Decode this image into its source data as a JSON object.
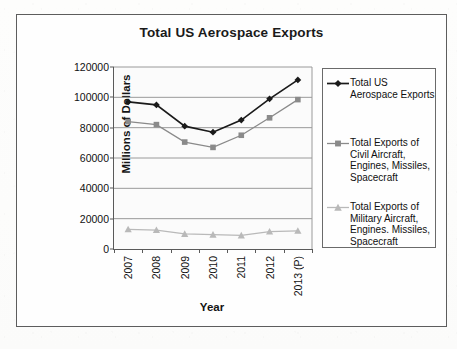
{
  "chart_data": {
    "type": "line",
    "title": "Total US Aerospace Exports",
    "xlabel": "Year",
    "ylabel": "Millions of Dollars",
    "categories": [
      "2007",
      "2008",
      "2009",
      "2010",
      "2011",
      "2012",
      "2013 (P)"
    ],
    "ylim": [
      0,
      120000
    ],
    "yticks": [
      0,
      20000,
      40000,
      60000,
      80000,
      100000,
      120000
    ],
    "ytick_labels": [
      "0",
      "20000",
      "40000",
      "60000",
      "80000",
      "100000",
      "120000"
    ],
    "grid": true,
    "legend_position": "right",
    "series": [
      {
        "name": "Total US Aerospace Exports",
        "marker": "diamond",
        "color": "#1a1a1a",
        "values": [
          97000,
          95000,
          81000,
          77000,
          85000,
          99000,
          111500
        ]
      },
      {
        "name": "Total Exports of Civil Aircraft, Engines, Missiles, Spacecraft",
        "marker": "square",
        "color": "#8a8a8a",
        "values": [
          84000,
          82000,
          70500,
          67000,
          75000,
          86500,
          98500
        ]
      },
      {
        "name": "Total Exports of Military Aircraft, Engines. Missiles, Spacecraft",
        "marker": "triangle",
        "color": "#b9b9b9",
        "values": [
          13000,
          12500,
          10000,
          9500,
          9000,
          11500,
          12000
        ]
      }
    ]
  },
  "legend": {
    "entries": [
      {
        "label": "Total US Aerospace Exports"
      },
      {
        "label": "Total Exports of Civil Aircraft, Engines, Missiles, Spacecraft"
      },
      {
        "label": "Total Exports of Military Aircraft, Engines. Missiles, Spacecraft"
      }
    ]
  },
  "colors": {
    "series_total": "#1a1a1a",
    "series_civil": "#8a8a8a",
    "series_military": "#b9b9b9",
    "gridline": "#9a9a9a",
    "axis": "#5a5a5a",
    "frame": "#5d5d5d",
    "plot_background": "#fbfbfb"
  }
}
